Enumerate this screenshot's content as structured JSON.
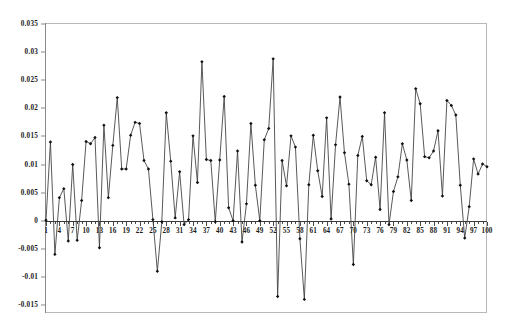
{
  "chart_data": {
    "type": "line",
    "title": "",
    "subtitle": "",
    "xlabel": "",
    "ylabel": "",
    "grid": false,
    "legend": false,
    "legend_position": "none",
    "marker": "filled-diamond",
    "line_color": "#3b3b3b",
    "marker_color": "#111111",
    "xlim": [
      1,
      100
    ],
    "ylim": [
      -0.015,
      0.035
    ],
    "y_tick_step": 0.005,
    "x_tick_step": 3,
    "y_ticks": [
      0.035,
      0.03,
      0.025,
      0.02,
      0.015,
      0.01,
      0.005,
      0,
      -0.005,
      -0.01,
      -0.015
    ],
    "y_tick_labels": [
      "0.035",
      "0.03",
      "0.025",
      "0.02",
      "0.015",
      "0.01",
      "0.005",
      "0",
      "-0.005",
      "-0.01",
      "-0.015"
    ],
    "x_ticks": [
      1,
      4,
      7,
      10,
      13,
      16,
      19,
      22,
      25,
      28,
      31,
      34,
      37,
      40,
      43,
      46,
      49,
      52,
      55,
      58,
      61,
      64,
      67,
      70,
      73,
      76,
      79,
      82,
      85,
      88,
      91,
      94,
      97,
      100
    ],
    "x_tick_labels": [
      "1",
      "4",
      "7",
      "10",
      "13",
      "16",
      "19",
      "22",
      "25",
      "28",
      "31",
      "34",
      "37",
      "40",
      "43",
      "46",
      "49",
      "52",
      "55",
      "58",
      "61",
      "64",
      "67",
      "70",
      "73",
      "76",
      "79",
      "82",
      "85",
      "88",
      "91",
      "94",
      "97",
      "100"
    ],
    "x": [
      1,
      2,
      3,
      4,
      5,
      6,
      7,
      8,
      9,
      10,
      11,
      12,
      13,
      14,
      15,
      16,
      17,
      18,
      19,
      20,
      21,
      22,
      23,
      24,
      25,
      26,
      27,
      28,
      29,
      30,
      31,
      32,
      33,
      34,
      35,
      36,
      37,
      38,
      39,
      40,
      41,
      42,
      43,
      44,
      45,
      46,
      47,
      48,
      49,
      50,
      51,
      52,
      53,
      54,
      55,
      56,
      57,
      58,
      59,
      60,
      61,
      62,
      63,
      64,
      65,
      66,
      67,
      68,
      69,
      70,
      71,
      72,
      73,
      74,
      75,
      76,
      77,
      78,
      79,
      80,
      81,
      82,
      83,
      84,
      85,
      86,
      87,
      88,
      89,
      90,
      91,
      92,
      93,
      94,
      95,
      96,
      97,
      98,
      99,
      100
    ],
    "values": [
      0.0001,
      0.014,
      -0.006,
      0.0041,
      0.0057,
      -0.0036,
      0.01,
      -0.0035,
      0.0036,
      0.0141,
      0.0137,
      0.0148,
      -0.0048,
      0.017,
      0.0041,
      0.0134,
      0.0219,
      0.0092,
      0.0092,
      0.0152,
      0.0175,
      0.0173,
      0.0107,
      0.0092,
      0.0002,
      -0.009,
      -0.0002,
      0.0192,
      0.0106,
      0.0005,
      0.0087,
      -0.0007,
      0.0002,
      0.0151,
      0.0068,
      0.0283,
      0.0109,
      0.0107,
      -0.0002,
      0.0108,
      0.0221,
      0.0023,
      0.0,
      0.0124,
      -0.0038,
      0.003,
      0.0173,
      0.0063,
      0.0,
      0.0144,
      0.0164,
      0.0288,
      -0.0135,
      0.0107,
      0.0062,
      0.0151,
      0.0131,
      -0.0032,
      -0.014,
      0.0064,
      0.0152,
      0.0089,
      0.0043,
      0.0183,
      0.0003,
      0.0135,
      0.022,
      0.0121,
      0.0065,
      -0.0078,
      0.0116,
      0.015,
      0.0071,
      0.0064,
      0.0113,
      0.002,
      0.0192,
      -0.0007,
      0.0052,
      0.0078,
      0.0137,
      0.0108,
      0.0036,
      0.0235,
      0.0208,
      0.0114,
      0.0112,
      0.0124,
      0.016,
      0.0044,
      0.0214,
      0.0205,
      0.0188,
      0.0063,
      -0.0031,
      0.0025,
      0.011,
      0.0083,
      0.0101,
      0.0096
    ]
  }
}
